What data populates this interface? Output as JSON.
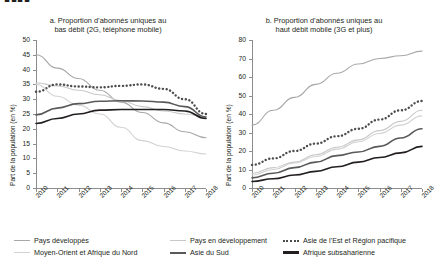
{
  "cutoff_header": "▮▮▮▮",
  "panel_a": {
    "title_line1": "a. Proportion d’abonnés uniques au",
    "title_line2": "bas débit (2G, téléphone mobile)"
  },
  "panel_b": {
    "title_line1": "b. Proportion d’abonnés uniques au",
    "title_line2": "haut débit mobile (3G et plus)"
  },
  "legend": {
    "items": [
      {
        "label": "Pays développés",
        "color": "#a8a8a8",
        "style": "solid",
        "width": 1.3
      },
      {
        "label": "Pays en développement",
        "color": "#c9c9c9",
        "style": "solid",
        "width": 1.3
      },
      {
        "label": "Asie de l’Est et Région pacifique",
        "color": "#4d4d4d",
        "style": "dotted",
        "width": 2.2
      },
      {
        "label": "Moyen-Orient et Afrique du Nord",
        "color": "#d2d2d2",
        "style": "solid",
        "width": 1.3
      },
      {
        "label": "Asie du Sud",
        "color": "#595959",
        "style": "solid",
        "width": 2.0
      },
      {
        "label": "Afrique subsaharienne",
        "color": "#231f20",
        "style": "solid",
        "width": 2.2
      }
    ]
  },
  "chart_data": [
    {
      "type": "line",
      "panel": "a",
      "title": "a. Proportion d’abonnés uniques au bas débit (2G, téléphone mobile)",
      "xlabel": "",
      "ylabel": "Part de la population (en %)",
      "x": [
        2010,
        2011,
        2012,
        2013,
        2014,
        2015,
        2016,
        2017,
        2018
      ],
      "xticklabels": [
        "2010",
        "2011",
        "2012",
        "2013",
        "2014",
        "2015",
        "2016",
        "2017",
        "2018"
      ],
      "ylim": [
        0,
        50
      ],
      "yticks": [
        0,
        5,
        10,
        15,
        20,
        25,
        30,
        35,
        40,
        45,
        50
      ],
      "grid": false,
      "legend_position": "below",
      "series": [
        {
          "name": "Pays développés",
          "color": "#a8a8a8",
          "style": "solid",
          "values": [
            45.0,
            40.5,
            37.0,
            33.0,
            29.0,
            25.5,
            22.0,
            19.0,
            17.0
          ]
        },
        {
          "name": "Pays en développement",
          "color": "#c9c9c9",
          "style": "solid",
          "values": [
            35.5,
            34.5,
            33.0,
            31.5,
            29.5,
            27.5,
            26.0,
            25.0,
            24.0
          ]
        },
        {
          "name": "Asie de l’Est et Région pacifique",
          "color": "#4d4d4d",
          "style": "dotted",
          "values": [
            32.5,
            35.0,
            34.3,
            34.0,
            34.5,
            35.0,
            33.5,
            30.0,
            25.0
          ]
        },
        {
          "name": "Moyen-Orient et Afrique du Nord",
          "color": "#d2d2d2",
          "style": "solid",
          "values": [
            35.0,
            31.0,
            28.0,
            25.0,
            20.5,
            16.0,
            14.0,
            12.5,
            11.5
          ]
        },
        {
          "name": "Asie du Sud",
          "color": "#595959",
          "style": "solid",
          "values": [
            24.7,
            27.0,
            28.5,
            29.3,
            29.5,
            29.4,
            29.0,
            27.5,
            24.0
          ]
        },
        {
          "name": "Afrique subsaharienne",
          "color": "#231f20",
          "style": "solid",
          "values": [
            21.8,
            23.5,
            25.0,
            26.3,
            26.5,
            26.5,
            26.5,
            26.0,
            23.5
          ]
        }
      ]
    },
    {
      "type": "line",
      "panel": "b",
      "title": "b. Proportion d’abonnés uniques au haut débit mobile (3G et plus)",
      "xlabel": "",
      "ylabel": "Part de la population (en %)",
      "x": [
        2010,
        2011,
        2012,
        2013,
        2014,
        2015,
        2016,
        2017,
        2018
      ],
      "xticklabels": [
        "2010",
        "2011",
        "2012",
        "2013",
        "2014",
        "2015",
        "2016",
        "2017",
        "2018"
      ],
      "ylim": [
        0,
        80
      ],
      "yticks": [
        0,
        10,
        20,
        30,
        40,
        50,
        60,
        70,
        80
      ],
      "grid": false,
      "legend_position": "below",
      "series": [
        {
          "name": "Pays développés",
          "color": "#a8a8a8",
          "style": "solid",
          "values": [
            34.0,
            42.0,
            49.0,
            56.0,
            62.0,
            67.0,
            70.0,
            71.5,
            74.0
          ]
        },
        {
          "name": "Pays en développement",
          "color": "#c9c9c9",
          "style": "solid",
          "values": [
            8.0,
            11.0,
            14.0,
            18.0,
            22.0,
            26.0,
            31.0,
            36.0,
            42.0
          ]
        },
        {
          "name": "Asie de l’Est et Région pacifique",
          "color": "#4d4d4d",
          "style": "dotted",
          "values": [
            12.5,
            16.0,
            20.0,
            24.0,
            28.0,
            32.0,
            37.0,
            42.0,
            47.0
          ]
        },
        {
          "name": "Moyen-Orient et Afrique du Nord",
          "color": "#d2d2d2",
          "style": "solid",
          "values": [
            7.0,
            10.0,
            13.5,
            17.0,
            21.0,
            25.0,
            29.5,
            34.0,
            39.0
          ]
        },
        {
          "name": "Asie du Sud",
          "color": "#595959",
          "style": "solid",
          "values": [
            5.5,
            8.0,
            11.0,
            14.0,
            17.5,
            19.5,
            22.5,
            27.0,
            32.0
          ]
        },
        {
          "name": "Afrique subsaharienne",
          "color": "#231f20",
          "style": "solid",
          "values": [
            3.5,
            5.0,
            7.0,
            9.0,
            11.5,
            14.0,
            16.5,
            19.0,
            22.5
          ]
        }
      ]
    }
  ]
}
